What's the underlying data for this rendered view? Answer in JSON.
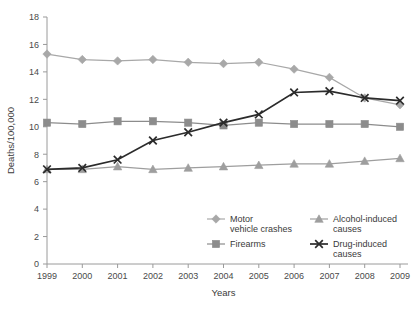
{
  "chart_data": {
    "type": "line",
    "title": "",
    "xlabel": "Years",
    "ylabel": "Deaths/100,000",
    "x": [
      1999,
      2000,
      2001,
      2002,
      2003,
      2004,
      2005,
      2006,
      2007,
      2008,
      2009
    ],
    "categories": [
      "1999",
      "2000",
      "2001",
      "2002",
      "2003",
      "2004",
      "2005",
      "2006",
      "2007",
      "2008",
      "2009"
    ],
    "xlim": [
      1999,
      2009
    ],
    "ylim": [
      0,
      18
    ],
    "yticks": [
      0,
      2,
      4,
      6,
      8,
      10,
      12,
      14,
      16,
      18
    ],
    "ytick_labels": [
      "0",
      "2",
      "4",
      "6",
      "8",
      "10",
      "12",
      "14",
      "16",
      "18"
    ],
    "grid": false,
    "legend_position": "inside-lower-right",
    "series": [
      {
        "name": "Motor vehicle crashes",
        "marker": "diamond",
        "color": "#a8a8a8",
        "values": [
          15.3,
          14.9,
          14.8,
          14.9,
          14.7,
          14.6,
          14.7,
          14.2,
          13.6,
          12.1,
          11.6
        ]
      },
      {
        "name": "Firearms",
        "marker": "square",
        "color": "#8c8c8c",
        "values": [
          10.3,
          10.2,
          10.4,
          10.4,
          10.3,
          10.1,
          10.3,
          10.2,
          10.2,
          10.2,
          10.0
        ]
      },
      {
        "name": "Alcohol-induced causes",
        "marker": "triangle",
        "color": "#9e9e9e",
        "values": [
          6.9,
          6.9,
          7.1,
          6.9,
          7.0,
          7.1,
          7.2,
          7.3,
          7.3,
          7.5,
          7.7
        ]
      },
      {
        "name": "Drug-induced causes",
        "marker": "cross",
        "color": "#2b2b2b",
        "values": [
          6.9,
          7.0,
          7.6,
          9.0,
          9.6,
          10.3,
          10.9,
          12.5,
          12.6,
          12.1,
          11.9
        ]
      }
    ]
  },
  "axis": {
    "y_title": "Deaths/100,000",
    "x_title": "Years"
  },
  "legend": {
    "entries": [
      {
        "label": "Motor vehicle crashes",
        "marker": "diamond",
        "color": "#a8a8a8"
      },
      {
        "label": "Alcohol-induced causes",
        "marker": "triangle",
        "color": "#9e9e9e"
      },
      {
        "label": "Firearms",
        "marker": "square",
        "color": "#8c8c8c"
      },
      {
        "label": "Drug-induced causes",
        "marker": "cross",
        "color": "#2b2b2b"
      }
    ]
  },
  "colors": {
    "axis": "#9a9a9a",
    "text": "#3a3a3a",
    "background": "#ffffff"
  }
}
